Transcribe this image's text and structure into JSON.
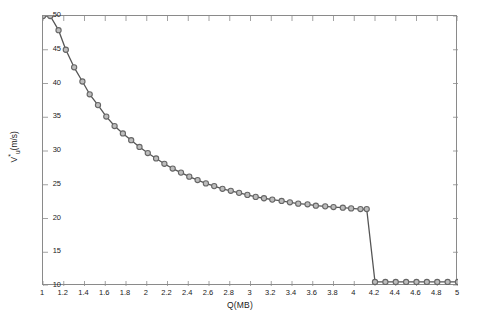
{
  "chart_data": {
    "type": "line",
    "title": "",
    "xlabel": "Q(MB)",
    "ylabel": "V*u(m/s)",
    "ylabel_base": "V",
    "ylabel_star": "*",
    "ylabel_sub": "u",
    "ylabel_unit": "(m/s)",
    "xlim": [
      1,
      5
    ],
    "ylim": [
      10,
      50
    ],
    "grid": false,
    "legend": null,
    "marker": "open-circle",
    "line_color": "#555555",
    "marker_color": "#666666",
    "marker_face": "#bdbdbd",
    "xticks": [
      1,
      1.2,
      1.4,
      1.6,
      1.8,
      2,
      2.2,
      2.4,
      2.6,
      2.8,
      3,
      3.2,
      3.4,
      3.6,
      3.8,
      4,
      4.2,
      4.4,
      4.6,
      4.8,
      5
    ],
    "xtick_labels": [
      "1",
      "1.2",
      "1.4",
      "1.6",
      "1.8",
      "2",
      "2.2",
      "2.4",
      "2.6",
      "2.8",
      "3",
      "3.2",
      "3.4",
      "3.6",
      "3.8",
      "4",
      "4.2",
      "4.4",
      "4.6",
      "4.8",
      "5"
    ],
    "yticks": [
      10,
      15,
      20,
      25,
      30,
      35,
      40,
      45,
      50
    ],
    "ytick_labels": [
      "10",
      "15",
      "20",
      "25",
      "30",
      "35",
      "40",
      "45",
      "50"
    ],
    "series": [
      {
        "name": "Vu",
        "x": [
          1.0,
          1.07,
          1.15,
          1.22,
          1.3,
          1.38,
          1.45,
          1.53,
          1.61,
          1.69,
          1.77,
          1.85,
          1.93,
          2.01,
          2.09,
          2.17,
          2.25,
          2.33,
          2.41,
          2.49,
          2.57,
          2.65,
          2.73,
          2.81,
          2.89,
          2.97,
          3.05,
          3.13,
          3.21,
          3.3,
          3.38,
          3.46,
          3.55,
          3.63,
          3.72,
          3.8,
          3.89,
          3.97,
          4.06,
          4.12,
          4.2,
          4.3,
          4.4,
          4.5,
          4.6,
          4.7,
          4.8,
          4.9,
          5.0
        ],
        "y": [
          50.0,
          50.0,
          47.9,
          45.0,
          42.4,
          40.3,
          38.4,
          36.8,
          35.1,
          33.7,
          32.6,
          31.6,
          30.6,
          29.7,
          28.9,
          28.1,
          27.4,
          26.8,
          26.2,
          25.7,
          25.2,
          24.8,
          24.4,
          24.1,
          23.8,
          23.5,
          23.2,
          23.0,
          22.8,
          22.6,
          22.4,
          22.2,
          22.1,
          21.9,
          21.8,
          21.7,
          21.6,
          21.5,
          21.4,
          21.4,
          10.6,
          10.6,
          10.6,
          10.6,
          10.6,
          10.6,
          10.6,
          10.6,
          10.6
        ]
      }
    ]
  }
}
